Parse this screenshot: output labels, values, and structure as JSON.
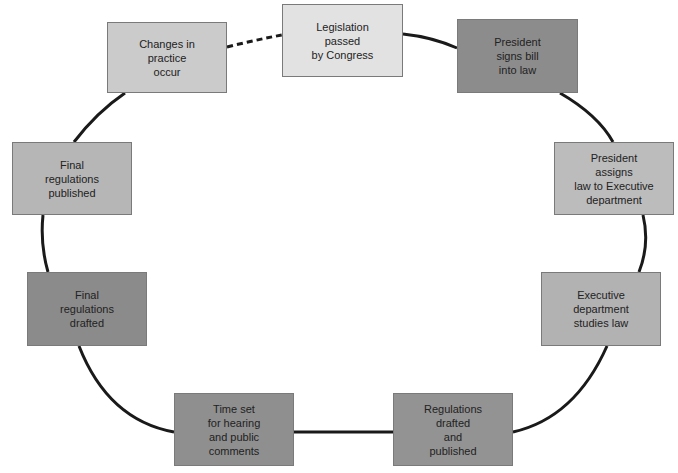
{
  "diagram": {
    "type": "cycle",
    "title": "",
    "nodes": [
      {
        "id": "legislation",
        "label": "Legislation\npassed\nby Congress",
        "color": "#e2e2e2"
      },
      {
        "id": "president-signs",
        "label": "President\nsigns bill\ninto law",
        "color": "#8c8c8c"
      },
      {
        "id": "president-assigns",
        "label": "President\nassigns\nlaw to Executive\ndepartment",
        "color": "#bcbcbc"
      },
      {
        "id": "executive-studies",
        "label": "Executive\ndepartment\nstudies law",
        "color": "#b2b2b2"
      },
      {
        "id": "regulations-drafted",
        "label": "Regulations\ndrafted\nand\npublished",
        "color": "#939393"
      },
      {
        "id": "time-set",
        "label": "Time set\nfor hearing\nand public\ncomments",
        "color": "#8f8f8f"
      },
      {
        "id": "final-drafted",
        "label": "Final\nregulations\ndrafted",
        "color": "#8b8b8b"
      },
      {
        "id": "final-published",
        "label": "Final\nregulations\npublished",
        "color": "#b6b6b6"
      },
      {
        "id": "changes-occur",
        "label": "Changes in\npractice\noccur",
        "color": "#cbcbcb"
      }
    ],
    "edges": [
      {
        "from": "legislation",
        "to": "president-signs",
        "style": "solid"
      },
      {
        "from": "president-signs",
        "to": "president-assigns",
        "style": "solid"
      },
      {
        "from": "president-assigns",
        "to": "executive-studies",
        "style": "solid"
      },
      {
        "from": "executive-studies",
        "to": "regulations-drafted",
        "style": "solid"
      },
      {
        "from": "regulations-drafted",
        "to": "time-set",
        "style": "solid"
      },
      {
        "from": "time-set",
        "to": "final-drafted",
        "style": "solid"
      },
      {
        "from": "final-drafted",
        "to": "final-published",
        "style": "solid"
      },
      {
        "from": "final-published",
        "to": "changes-occur",
        "style": "solid"
      },
      {
        "from": "changes-occur",
        "to": "legislation",
        "style": "dashed"
      }
    ],
    "line_color": "#1a1a1a"
  }
}
